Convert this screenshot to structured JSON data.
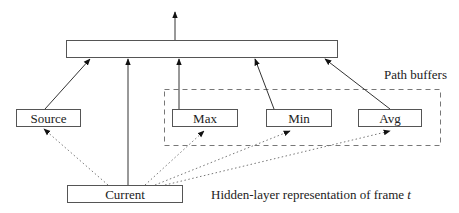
{
  "diagram": {
    "nodes": {
      "output": {
        "label": ""
      },
      "source": {
        "label": "Source"
      },
      "max": {
        "label": "Max"
      },
      "min": {
        "label": "Min"
      },
      "avg": {
        "label": "Avg"
      },
      "current": {
        "label": "Current"
      }
    },
    "group": {
      "label": "Path buffers",
      "members": [
        "Max",
        "Min",
        "Avg"
      ]
    },
    "annotation": {
      "text_prefix": "Hidden-layer representation of frame ",
      "text_var": "t"
    },
    "edges": [
      {
        "from": "Source",
        "to": "output",
        "style": "solid"
      },
      {
        "from": "Current",
        "to": "output",
        "style": "solid"
      },
      {
        "from": "Max",
        "to": "output",
        "style": "solid"
      },
      {
        "from": "Min",
        "to": "output",
        "style": "solid"
      },
      {
        "from": "Avg",
        "to": "output",
        "style": "solid"
      },
      {
        "from": "output",
        "to": "up",
        "style": "solid"
      },
      {
        "from": "Current",
        "to": "Source",
        "style": "dotted"
      },
      {
        "from": "Current",
        "to": "Max",
        "style": "dotted"
      },
      {
        "from": "Current",
        "to": "Min",
        "style": "dotted"
      },
      {
        "from": "Current",
        "to": "Avg",
        "style": "dotted"
      }
    ]
  }
}
